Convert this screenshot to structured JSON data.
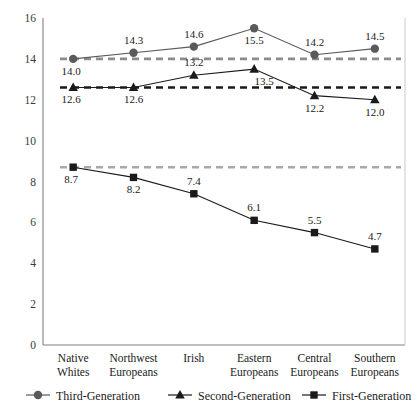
{
  "chart_data": {
    "type": "line",
    "title": "",
    "subtitle": "",
    "xlabel": "",
    "ylabel": "",
    "ylim": [
      0,
      16
    ],
    "yticks": [
      0,
      2,
      4,
      6,
      8,
      10,
      12,
      14,
      16
    ],
    "grid": false,
    "legend_position": "bottom",
    "categories": [
      "Native Whites",
      "Northwest Europeans",
      "Irish",
      "Eastern Europeans",
      "Central Europeans",
      "Southern Europeans"
    ],
    "category_lines": [
      [
        "Native",
        "Whites"
      ],
      [
        "Northwest",
        "Europeans"
      ],
      [
        "Irish",
        ""
      ],
      [
        "Eastern",
        "Europeans"
      ],
      [
        "Central",
        "Europeans"
      ],
      [
        "Southern",
        "Europeans"
      ]
    ],
    "series": [
      {
        "name": "Third-Generation",
        "marker": "circle",
        "color": "#5a5a5a",
        "values": [
          14.0,
          14.3,
          14.6,
          15.5,
          14.2,
          14.5
        ],
        "labels": [
          "14.0",
          "14.3",
          "14.6",
          "15.5",
          "14.2",
          "14.5"
        ],
        "label_positions": [
          "below-left",
          "above",
          "above",
          "below",
          "above",
          "above"
        ],
        "reference_line": 14.0,
        "reference_color": "#8c8c8c"
      },
      {
        "name": "Second-Generation",
        "marker": "triangle",
        "color": "#1a1a1a",
        "values": [
          12.6,
          12.6,
          13.2,
          13.5,
          12.2,
          12.0
        ],
        "labels": [
          "12.6",
          "12.6",
          "13.2",
          "13.5",
          "12.2",
          "12.0"
        ],
        "label_positions": [
          "below-left",
          "below",
          "above",
          "below-right",
          "below",
          "below"
        ],
        "reference_line": 12.6,
        "reference_color": "#1a1a1a"
      },
      {
        "name": "First-Generation",
        "marker": "square",
        "color": "#1a1a1a",
        "values": [
          8.7,
          8.2,
          7.4,
          6.1,
          5.5,
          4.7
        ],
        "labels": [
          "8.7",
          "8.2",
          "7.4",
          "6.1",
          "5.5",
          "4.7"
        ],
        "label_positions": [
          "below-left",
          "below",
          "above",
          "above",
          "above",
          "above"
        ],
        "reference_line": 8.7,
        "reference_color": "#a8a8a8"
      }
    ],
    "legend": [
      {
        "label": "Third-Generation",
        "marker": "circle",
        "color": "#5a5a5a"
      },
      {
        "label": "Second-Generation",
        "marker": "triangle",
        "color": "#1a1a1a"
      },
      {
        "label": "First-Generation",
        "marker": "square",
        "color": "#1a1a1a"
      }
    ]
  },
  "axis": {
    "y_tick_labels": [
      "16",
      "14",
      "12",
      "10",
      "8",
      "6",
      "4",
      "2",
      "0"
    ]
  }
}
